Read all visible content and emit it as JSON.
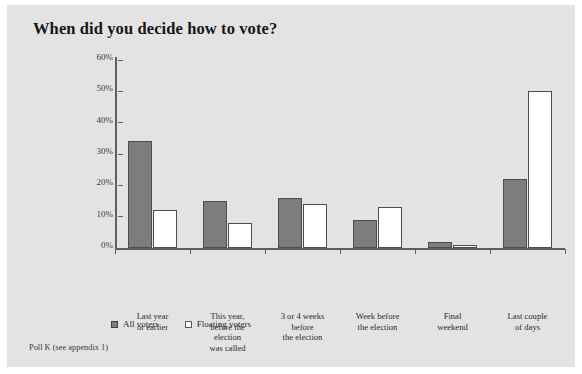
{
  "chart_data": {
    "type": "bar",
    "title": "When did you decide how to vote?",
    "xlabel": "",
    "ylabel": "",
    "ylim": [
      0,
      60
    ],
    "ytick_labels": [
      "0%",
      "10%",
      "20%",
      "30%",
      "40%",
      "50%",
      "60%"
    ],
    "ytick_values": [
      0,
      10,
      20,
      30,
      40,
      50,
      60
    ],
    "grid": false,
    "legend_position": "bottom-left",
    "categories": [
      "Last year\nor earlier",
      "This year,\nbefore the\nelection\nwas called",
      "3 or 4 weeks\nbefore\nthe election",
      "Week before\nthe election",
      "Final\nweekend",
      "Last couple\nof days"
    ],
    "series": [
      {
        "name": "All voters",
        "values": [
          34,
          15,
          16,
          9,
          2,
          22
        ],
        "color": "#7d7d7d"
      },
      {
        "name": "Floating voters",
        "values": [
          12,
          8,
          14,
          13,
          1,
          50
        ],
        "color": "#ffffff"
      }
    ],
    "source_note": "Poll K (see appendix 1)"
  },
  "colors": {
    "panel_background": "#e3e3e3",
    "page_background": "#ffffff",
    "axis": "#5e5e5e",
    "bar_fill_all_voters": "#7d7d7d",
    "bar_fill_floating_voters": "#ffffff",
    "bar_border": "#4d4d4d",
    "title_text": "#171717",
    "label_text": "#2c2c2c"
  }
}
